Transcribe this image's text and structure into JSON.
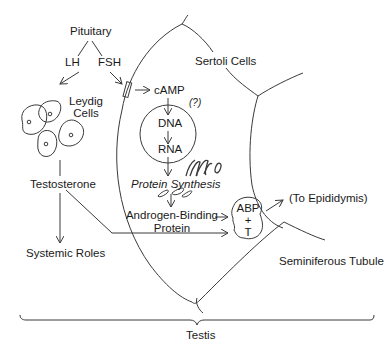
{
  "diagram": {
    "labels": {
      "pituitary": "Pituitary",
      "lh": "LH",
      "fsh": "FSH",
      "leydig_line1": "Leydig",
      "leydig_line2": "Cells",
      "testosterone": "Testosterone",
      "systemic_roles": "Systemic Roles",
      "sertoli_cells": "Sertoli Cells",
      "camp": "cAMP",
      "question": "(?)",
      "dna": "DNA",
      "rna": "RNA",
      "protein_synthesis": "Protein Synthesis",
      "abp_line1": "Androgen-Binding",
      "abp_line2": "Protein",
      "complex_line1": "ABP",
      "complex_line2": "+",
      "complex_line3": "T",
      "to_epididymis": "(To Epididymis)",
      "seminiferous_tubule": "Seminiferous Tubule",
      "testis": "Testis"
    },
    "colors": {
      "stroke": "#3a3a3a",
      "text": "#1a1a1a",
      "background": "#ffffff"
    }
  }
}
